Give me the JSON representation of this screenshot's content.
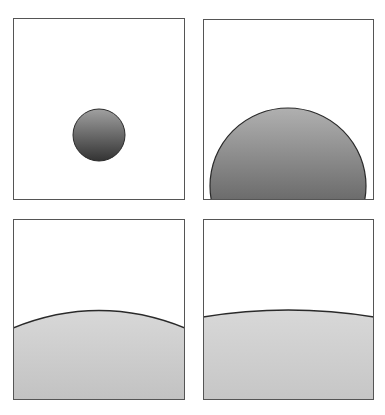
{
  "figure": {
    "colors": {
      "background": "#ffffff",
      "frame": "#555555",
      "outline": "#2a2a2a",
      "dark_gradient_top": "#a8a8a8",
      "dark_gradient_bottom": "#3a3a3a",
      "light_fill_top": "#d6d6d6",
      "light_fill_bottom": "#c4c4c4"
    },
    "panels": [
      {
        "id": "top-left",
        "label": "small-circle",
        "x": 13,
        "y": 18,
        "w": 172,
        "h": 182
      },
      {
        "id": "top-right",
        "label": "large-half-circle",
        "x": 203,
        "y": 19,
        "w": 171,
        "h": 181
      },
      {
        "id": "bottom-left",
        "label": "gentle-arc",
        "x": 13,
        "y": 219,
        "w": 172,
        "h": 181
      },
      {
        "id": "bottom-right",
        "label": "nearly-flat-arc",
        "x": 203,
        "y": 219,
        "w": 171,
        "h": 181
      }
    ]
  }
}
